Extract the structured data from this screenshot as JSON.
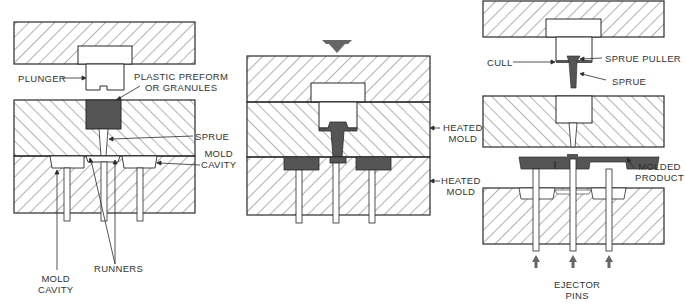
{
  "diagram": {
    "colors": {
      "outline": "#2a2a2a",
      "hatch": "#555555",
      "plastic": "#555555",
      "arrow": "#666666",
      "background": "#ffffff"
    },
    "stage1": {
      "labels": {
        "plunger": "PLUNGER",
        "preform_line1": "PLASTIC PREFORM",
        "preform_line2": "OR GRANULES",
        "sprue": "SPRUE",
        "cavity_right_line1": "MOLD",
        "cavity_right_line2": "CAVITY",
        "runners": "RUNNERS",
        "cavity_bottom_line1": "MOLD",
        "cavity_bottom_line2": "CAVITY"
      }
    },
    "stage2": {
      "labels": {
        "heated_upper_line1": "HEATED",
        "heated_upper_line2": "MOLD",
        "heated_lower_line1": "HEATED",
        "heated_lower_line2": "MOLD"
      },
      "press_arrow": "down-arrow-icon"
    },
    "stage3": {
      "labels": {
        "cull": "CULL",
        "sprue_puller": "SPRUE PULLER",
        "sprue": "SPRUE",
        "molded_line1": "MOLDED",
        "molded_line2": "PRODUCT",
        "ejector_line1": "EJECTOR",
        "ejector_line2": "PINS"
      },
      "ejector_arrows": [
        "up-arrow-icon",
        "up-arrow-icon",
        "up-arrow-icon"
      ]
    }
  }
}
